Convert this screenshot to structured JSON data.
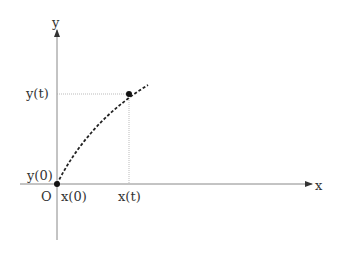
{
  "diagram": {
    "axes": {
      "x_label": "x",
      "y_label": "y",
      "origin_label": "O"
    },
    "tick_labels": {
      "x0": "x(0)",
      "xt": "x(t)",
      "y0": "y(0)",
      "yt": "y(t)"
    },
    "points": [
      {
        "name": "start",
        "x": 57,
        "y": 184
      },
      {
        "name": "current",
        "x": 129,
        "y": 94
      }
    ],
    "colors": {
      "axis": "#777777",
      "curve": "#222222",
      "guide": "#aaaaaa"
    }
  }
}
